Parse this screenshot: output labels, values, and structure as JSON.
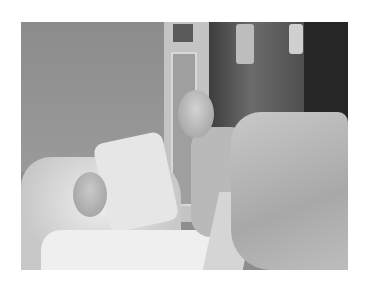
{
  "image": {
    "description": "Grayscale photo of a hospital room: a bald patient lying in bed against large white pillows, a bald visitor with glasses leaning in smiling, another person in a protective gown on the right, IV bags and medical equipment in the background."
  }
}
